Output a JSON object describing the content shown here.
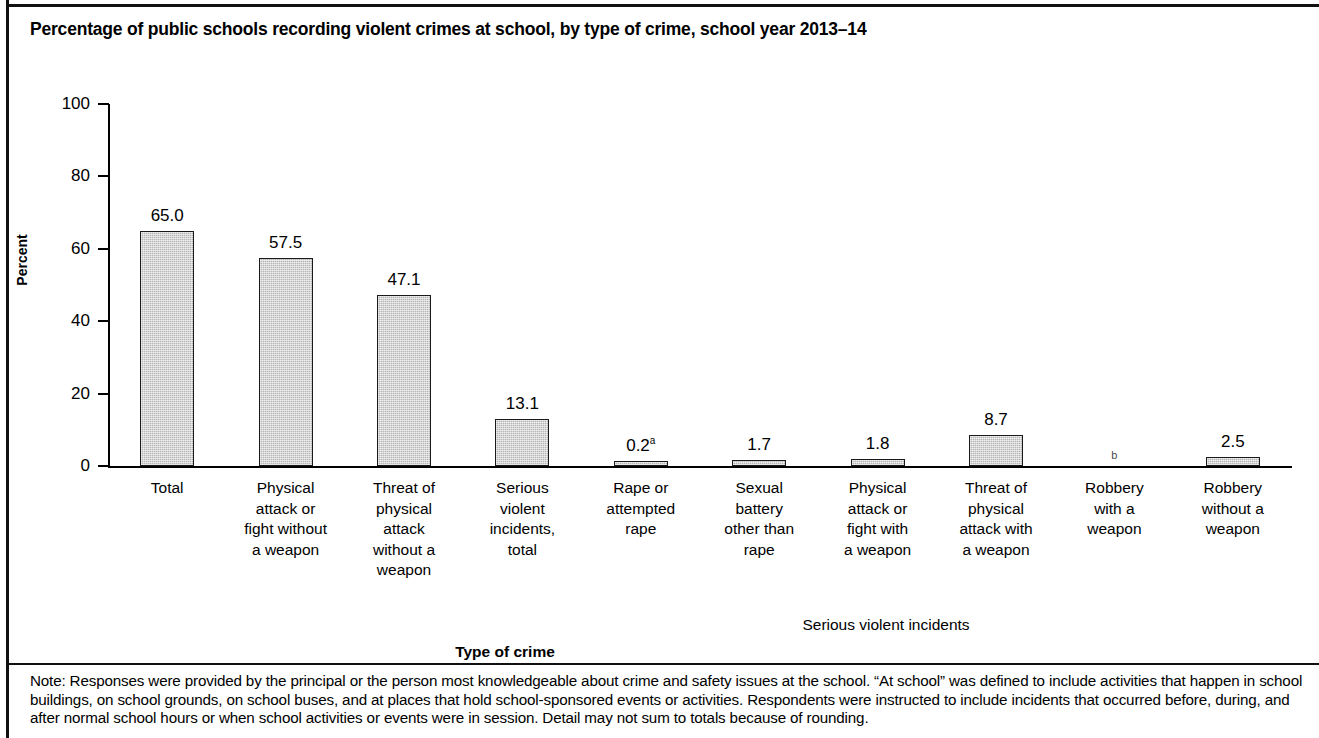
{
  "title": "Percentage of public schools recording violent crimes at school, by type of crime, school year 2013–14",
  "axes": {
    "y_title": "Percent",
    "x_title": "Type of crime",
    "group_annotation": "Serious violent incidents",
    "y_ticks": [
      "100",
      "80",
      "60",
      "40",
      "20",
      "0"
    ]
  },
  "note": "Note: Responses were provided by the principal or the person most knowledgeable about crime and safety issues at the school. “At school” was defined to include activities that happen in school buildings, on school grounds, on school buses, and at places that hold school-sponsored events or activities. Respondents were instructed to include incidents that occurred before, during, and after normal school hours or when school activities or events were in session. Detail may not sum to totals because of rounding.",
  "chart_data": {
    "type": "bar",
    "title": "Percentage of public schools recording violent crimes at school, by type of crime, school year 2013–14",
    "xlabel": "Type of crime",
    "ylabel": "Percent",
    "ylim": [
      0,
      100
    ],
    "yticks": [
      0,
      20,
      40,
      60,
      80,
      100
    ],
    "grid": false,
    "legend": null,
    "categories": [
      "Total",
      "Physical attack or fight without a weapon",
      "Threat of physical attack without a weapon",
      "Serious violent incidents, total",
      "Rape or attempted rape",
      "Sexual battery other than rape",
      "Physical attack or fight with a weapon",
      "Threat of physical attack with a weapon",
      "Robbery with a weapon",
      "Robbery without a weapon"
    ],
    "category_lines": [
      [
        "Total"
      ],
      [
        "Physical",
        "attack or",
        "fight without",
        "a weapon"
      ],
      [
        "Threat of",
        "physical",
        "attack",
        "without a",
        "weapon"
      ],
      [
        "Serious",
        "violent",
        "incidents,",
        "total"
      ],
      [
        "Rape or",
        "attempted",
        "rape"
      ],
      [
        "Sexual",
        "battery",
        "other than",
        "rape"
      ],
      [
        "Physical",
        "attack or",
        "fight with",
        "a weapon"
      ],
      [
        "Threat of",
        "physical",
        "attack with",
        "a weapon"
      ],
      [
        "Robbery",
        "with a",
        "weapon"
      ],
      [
        "Robbery",
        "without a",
        "weapon"
      ]
    ],
    "values": [
      65.0,
      57.5,
      47.1,
      13.1,
      0.2,
      1.7,
      1.8,
      8.7,
      null,
      2.5
    ],
    "value_labels": [
      "65.0",
      "57.5",
      "47.1",
      "13.1",
      "0.2",
      "1.7",
      "1.8",
      "8.7",
      "b",
      "2.5"
    ],
    "value_label_superscripts": [
      "",
      "",
      "",
      "",
      "a",
      "",
      "",
      "",
      "",
      ""
    ],
    "annotations": [
      {
        "text": "Serious violent incidents",
        "covers": [
          "Rape or attempted rape",
          "Sexual battery other than rape",
          "Physical attack or fight with a weapon",
          "Threat of physical attack with a weapon",
          "Robbery with a weapon",
          "Robbery without a weapon"
        ]
      }
    ]
  },
  "colors": {
    "bar_fill": "#b6b6b6",
    "bar_outline": "#1a1a1a",
    "axis": "#000000",
    "background": "#ffffff"
  }
}
